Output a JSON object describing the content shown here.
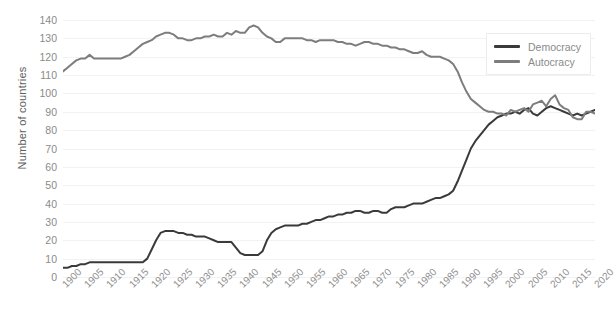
{
  "chart_data": {
    "type": "line",
    "title": "",
    "xlabel": "",
    "ylabel": "Number of countries",
    "xlim": [
      1900,
      2020
    ],
    "ylim": [
      0,
      140
    ],
    "ytick_step": 10,
    "xtick_step": 5,
    "grid": true,
    "legend_position": "top-right",
    "yticks": [
      "0",
      "10",
      "20",
      "30",
      "40",
      "50",
      "60",
      "70",
      "80",
      "90",
      "100",
      "110",
      "120",
      "130",
      "140"
    ],
    "xticks": [
      "1900",
      "1905",
      "1910",
      "1915",
      "1920",
      "1925",
      "1930",
      "1935",
      "1940",
      "1945",
      "1950",
      "1955",
      "1960",
      "1965",
      "1970",
      "1975",
      "1980",
      "1985",
      "1990",
      "1995",
      "2000",
      "2005",
      "2010",
      "2015",
      "2020"
    ],
    "x": [
      1900,
      1901,
      1902,
      1903,
      1904,
      1905,
      1906,
      1907,
      1908,
      1909,
      1910,
      1911,
      1912,
      1913,
      1914,
      1915,
      1916,
      1917,
      1918,
      1919,
      1920,
      1921,
      1922,
      1923,
      1924,
      1925,
      1926,
      1927,
      1928,
      1929,
      1930,
      1931,
      1932,
      1933,
      1934,
      1935,
      1936,
      1937,
      1938,
      1939,
      1940,
      1941,
      1942,
      1943,
      1944,
      1945,
      1946,
      1947,
      1948,
      1949,
      1950,
      1951,
      1952,
      1953,
      1954,
      1955,
      1956,
      1957,
      1958,
      1959,
      1960,
      1961,
      1962,
      1963,
      1964,
      1965,
      1966,
      1967,
      1968,
      1969,
      1970,
      1971,
      1972,
      1973,
      1974,
      1975,
      1976,
      1977,
      1978,
      1979,
      1980,
      1981,
      1982,
      1983,
      1984,
      1985,
      1986,
      1987,
      1988,
      1989,
      1990,
      1991,
      1992,
      1993,
      1994,
      1995,
      1996,
      1997,
      1998,
      1999,
      2000,
      2001,
      2002,
      2003,
      2004,
      2005,
      2006,
      2007,
      2008,
      2009,
      2010,
      2011,
      2012,
      2013,
      2014,
      2015,
      2016,
      2017,
      2018,
      2019,
      2020
    ],
    "series": [
      {
        "name": "Democracy",
        "color": "#3a3a3a",
        "values": [
          5,
          5,
          6,
          6,
          7,
          7,
          8,
          8,
          8,
          8,
          8,
          8,
          8,
          8,
          8,
          8,
          8,
          8,
          8,
          10,
          15,
          20,
          24,
          25,
          25,
          25,
          24,
          24,
          23,
          23,
          22,
          22,
          22,
          21,
          20,
          19,
          19,
          19,
          19,
          16,
          13,
          12,
          12,
          12,
          12,
          14,
          20,
          24,
          26,
          27,
          28,
          28,
          28,
          28,
          29,
          29,
          30,
          31,
          31,
          32,
          33,
          33,
          34,
          34,
          35,
          35,
          36,
          36,
          35,
          35,
          36,
          36,
          35,
          35,
          37,
          38,
          38,
          38,
          39,
          40,
          40,
          40,
          41,
          42,
          43,
          43,
          44,
          45,
          47,
          52,
          58,
          64,
          70,
          74,
          77,
          80,
          83,
          85,
          87,
          88,
          89,
          89,
          90,
          89,
          91,
          92,
          89,
          88,
          90,
          92,
          93,
          92,
          91,
          90,
          89,
          88,
          89,
          88,
          89,
          90,
          91
        ]
      },
      {
        "name": "Autocracy",
        "color": "#7d7d7d",
        "values": [
          112,
          114,
          116,
          118,
          119,
          119,
          121,
          119,
          119,
          119,
          119,
          119,
          119,
          119,
          120,
          121,
          123,
          125,
          127,
          128,
          129,
          131,
          132,
          133,
          133,
          132,
          130,
          130,
          129,
          129,
          130,
          130,
          131,
          131,
          132,
          131,
          131,
          133,
          132,
          134,
          133,
          133,
          136,
          137,
          136,
          133,
          131,
          130,
          128,
          128,
          130,
          130,
          130,
          130,
          130,
          129,
          129,
          128,
          129,
          129,
          129,
          129,
          128,
          128,
          127,
          127,
          126,
          127,
          128,
          128,
          127,
          127,
          126,
          126,
          125,
          125,
          124,
          124,
          123,
          122,
          122,
          123,
          121,
          120,
          120,
          120,
          119,
          118,
          116,
          112,
          106,
          101,
          97,
          95,
          93,
          91,
          90,
          90,
          89,
          89,
          88,
          91,
          90,
          91,
          92,
          90,
          94,
          95,
          96,
          93,
          97,
          99,
          94,
          92,
          91,
          87,
          86,
          86,
          90,
          90,
          89
        ]
      }
    ]
  }
}
